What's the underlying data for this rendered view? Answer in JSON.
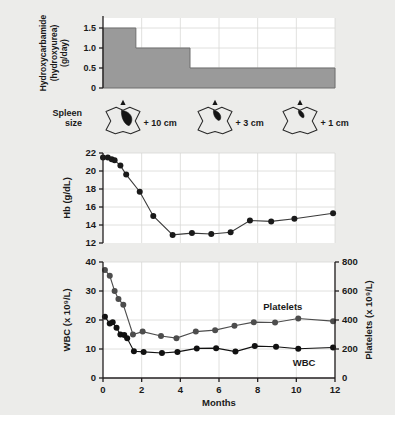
{
  "figure": {
    "background": "#ececea",
    "plot_background": "#ffffff",
    "axis_color": "#231f20",
    "grid_color": "#d8d8d6",
    "xlabel": "Months",
    "x_ticks": [
      0,
      2,
      4,
      6,
      8,
      10,
      12
    ],
    "xlim": [
      0,
      12
    ]
  },
  "chart_data": [
    {
      "type": "area",
      "id": "hydroxycarbamide-dose",
      "title": "",
      "ylabel": "Hydroxycarbamide (hydroxyurea) (g/day)",
      "ylabel_lines": [
        "Hydroxycarbamide",
        "(hydroxyurea)",
        "(g/day)"
      ],
      "xlabel": "",
      "ylim": [
        0,
        1.75
      ],
      "y_ticks": [
        0,
        0.5,
        1.0,
        1.5
      ],
      "y_tick_labels": [
        "0",
        "0.5",
        "1.0",
        "1.5"
      ],
      "xlim": [
        0,
        12
      ],
      "grid": true,
      "fill_color": "#9a9a9a",
      "steps": [
        {
          "x_start": 0,
          "x_end": 1.7,
          "value": 1.5
        },
        {
          "x_start": 1.7,
          "x_end": 4.5,
          "value": 1.0
        },
        {
          "x_start": 4.5,
          "x_end": 12,
          "value": 0.5
        }
      ]
    },
    {
      "type": "line",
      "id": "hemoglobin",
      "ylabel": "Hb (g/dL)",
      "xlabel": "",
      "ylim": [
        12,
        22
      ],
      "y_ticks": [
        12,
        14,
        16,
        18,
        20,
        22
      ],
      "xlim": [
        0,
        12
      ],
      "grid": true,
      "marker_color": "#1a1a1a",
      "line_color": "#3a3a3a",
      "points": [
        {
          "x": 0.0,
          "y": 21.5
        },
        {
          "x": 0.25,
          "y": 21.5
        },
        {
          "x": 0.45,
          "y": 21.3
        },
        {
          "x": 0.6,
          "y": 21.2
        },
        {
          "x": 0.9,
          "y": 20.6
        },
        {
          "x": 1.2,
          "y": 19.6
        },
        {
          "x": 1.9,
          "y": 17.7
        },
        {
          "x": 2.6,
          "y": 15.0
        },
        {
          "x": 3.6,
          "y": 12.9
        },
        {
          "x": 4.6,
          "y": 13.1
        },
        {
          "x": 5.6,
          "y": 13.0
        },
        {
          "x": 6.6,
          "y": 13.2
        },
        {
          "x": 7.6,
          "y": 14.5
        },
        {
          "x": 8.7,
          "y": 14.4
        },
        {
          "x": 9.9,
          "y": 14.7
        },
        {
          "x": 11.9,
          "y": 15.3
        }
      ]
    },
    {
      "type": "line",
      "id": "wbc-platelets",
      "ylabel": "WBC (x 10⁹/L)",
      "ylabel2": "Platelets (x 10⁹/L)",
      "xlabel": "Months",
      "ylim": [
        0,
        40
      ],
      "y_ticks": [
        10,
        20,
        30,
        40
      ],
      "ylim2": [
        0,
        800
      ],
      "y2_ticks": [
        200,
        400,
        600,
        800
      ],
      "xlim": [
        0,
        12
      ],
      "grid": true,
      "series": [
        {
          "name": "Platelets",
          "axis": "right",
          "color": "#4d4d4d",
          "label_x": 9.3,
          "label_y_value": 470,
          "points": [
            {
              "x": 0.1,
              "y": 745
            },
            {
              "x": 0.35,
              "y": 705
            },
            {
              "x": 0.6,
              "y": 600
            },
            {
              "x": 0.8,
              "y": 545
            },
            {
              "x": 1.05,
              "y": 505
            },
            {
              "x": 1.55,
              "y": 300
            },
            {
              "x": 2.05,
              "y": 320
            },
            {
              "x": 3.0,
              "y": 290
            },
            {
              "x": 3.8,
              "y": 275
            },
            {
              "x": 4.8,
              "y": 320
            },
            {
              "x": 5.8,
              "y": 330
            },
            {
              "x": 6.8,
              "y": 360
            },
            {
              "x": 7.8,
              "y": 385
            },
            {
              "x": 8.9,
              "y": 383
            },
            {
              "x": 10.1,
              "y": 410
            },
            {
              "x": 11.9,
              "y": 392
            }
          ]
        },
        {
          "name": "WBC",
          "axis": "left",
          "color": "#111111",
          "label_x": 10.4,
          "label_y_value": 4.2,
          "points": [
            {
              "x": 0.1,
              "y": 21.1
            },
            {
              "x": 0.35,
              "y": 18.8
            },
            {
              "x": 0.5,
              "y": 19.2
            },
            {
              "x": 0.7,
              "y": 17.3
            },
            {
              "x": 0.9,
              "y": 15.0
            },
            {
              "x": 1.1,
              "y": 14.8
            },
            {
              "x": 1.25,
              "y": 13.7
            },
            {
              "x": 1.6,
              "y": 9.2
            },
            {
              "x": 2.1,
              "y": 9.0
            },
            {
              "x": 3.05,
              "y": 8.6
            },
            {
              "x": 3.85,
              "y": 9.0
            },
            {
              "x": 4.85,
              "y": 10.2
            },
            {
              "x": 5.85,
              "y": 10.3
            },
            {
              "x": 6.85,
              "y": 9.1
            },
            {
              "x": 7.85,
              "y": 11.0
            },
            {
              "x": 8.95,
              "y": 10.8
            },
            {
              "x": 10.1,
              "y": 10.1
            },
            {
              "x": 11.9,
              "y": 10.5
            }
          ]
        }
      ]
    }
  ],
  "spleen": {
    "label_lines": [
      "Spleen",
      "size"
    ],
    "measurements": [
      {
        "value": "+ 10 cm",
        "x_center": 123,
        "spleen_scale": 1.0
      },
      {
        "value": "+ 3 cm",
        "x_center": 215,
        "spleen_scale": 0.6
      },
      {
        "value": "+ 1 cm",
        "x_center": 300,
        "spleen_scale": 0.38
      }
    ]
  }
}
